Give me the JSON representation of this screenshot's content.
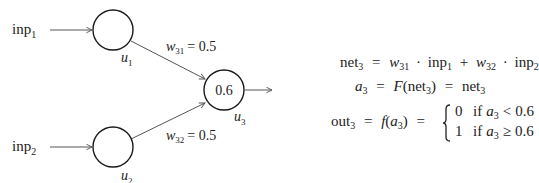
{
  "diagram": {
    "inputs": [
      {
        "label": "inp",
        "sub": "1"
      },
      {
        "label": "inp",
        "sub": "2"
      }
    ],
    "neurons": [
      {
        "name": "u",
        "sub": "1",
        "value": ""
      },
      {
        "name": "u",
        "sub": "2",
        "value": ""
      },
      {
        "name": "u",
        "sub": "3",
        "value": "0.6"
      }
    ],
    "weights": [
      {
        "symbol": "w",
        "sub": "31",
        "value": "= 0.5"
      },
      {
        "symbol": "w",
        "sub": "32",
        "value": "= 0.5"
      }
    ],
    "colors": {
      "stroke": "#1a1a1a",
      "edge": "#555555",
      "text": "#222222"
    }
  },
  "equations": {
    "net": {
      "lhs": "net",
      "lhs_sub": "3",
      "eq": "=",
      "w1": "w",
      "w1_sub": "31",
      "dot1": "·",
      "inp1": "inp",
      "inp1_sub": "1",
      "plus": "+",
      "w2": "w",
      "w2_sub": "32",
      "dot2": "·",
      "inp2": "inp",
      "inp2_sub": "2"
    },
    "activation": {
      "lhs": "a",
      "lhs_sub": "3",
      "eq1": "=",
      "F": "F",
      "open": "(",
      "arg": "net",
      "arg_sub": "3",
      "close": ")",
      "eq2": "=",
      "rhs": "net",
      "rhs_sub": "3"
    },
    "output": {
      "lhs": "out",
      "lhs_sub": "3",
      "eq1": "=",
      "f": "f",
      "open": "(",
      "arg": "a",
      "arg_sub": "3",
      "close": ")",
      "eq2": "=",
      "cases": [
        {
          "value": "0",
          "cond": "if",
          "var": "a",
          "var_sub": "3",
          "op": "<",
          "threshold": "0.6"
        },
        {
          "value": "1",
          "cond": "if",
          "var": "a",
          "var_sub": "3",
          "op": "≥",
          "threshold": "0.6"
        }
      ]
    }
  }
}
